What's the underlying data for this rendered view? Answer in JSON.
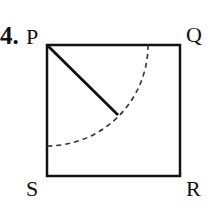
{
  "problem": {
    "number": "4.",
    "figure": {
      "type": "square-with-quarter-arc",
      "vertices": {
        "top_left": "P",
        "top_right": "Q",
        "bottom_left": "S",
        "bottom_right": "R"
      },
      "elements": [
        "square PQRS (solid)",
        "dashed quarter-circle arc centered at P",
        "solid radius segment from P to the arc"
      ],
      "colors": {
        "stroke": "#111111",
        "background": "#ffffff"
      }
    }
  }
}
